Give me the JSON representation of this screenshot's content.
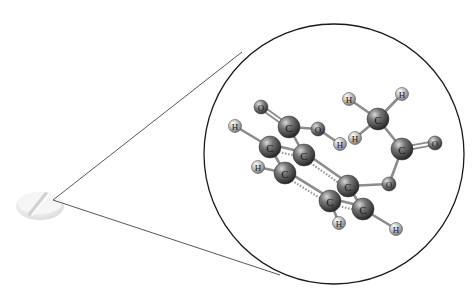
{
  "diagram": {
    "tablet": {
      "cx": 40,
      "cy": 205,
      "label": ""
    },
    "zoom_lines": {
      "apex": [
        53,
        200
      ],
      "upper_end": [
        242,
        52
      ],
      "lower_end": [
        280,
        275
      ]
    },
    "magnifier_circle": {
      "cx": 334,
      "cy": 154,
      "r": 130
    },
    "colors": {
      "carbon": "#3a3a3a",
      "oxygen": "#555555",
      "hydrogen": "#b8b8b8",
      "bond": "#8c8c8c",
      "outline": "#1a1a1a"
    },
    "atoms": [
      {
        "id": "O1",
        "el": "O",
        "x": 261,
        "y": 107
      },
      {
        "id": "C7",
        "el": "C",
        "x": 289,
        "y": 127
      },
      {
        "id": "O2",
        "el": "O",
        "x": 318,
        "y": 129
      },
      {
        "id": "H1",
        "el": "H",
        "x": 340,
        "y": 144
      },
      {
        "id": "H2",
        "el": "H",
        "x": 235,
        "y": 126
      },
      {
        "id": "C1",
        "el": "C",
        "x": 270,
        "y": 147
      },
      {
        "id": "C2",
        "el": "C",
        "x": 304,
        "y": 155
      },
      {
        "id": "H3",
        "el": "H",
        "x": 258,
        "y": 167
      },
      {
        "id": "C3",
        "el": "C",
        "x": 285,
        "y": 173
      },
      {
        "id": "C4",
        "el": "C",
        "x": 348,
        "y": 186
      },
      {
        "id": "C5",
        "el": "C",
        "x": 330,
        "y": 201
      },
      {
        "id": "C6",
        "el": "C",
        "x": 363,
        "y": 209
      },
      {
        "id": "H4",
        "el": "H",
        "x": 339,
        "y": 223
      },
      {
        "id": "H5",
        "el": "H",
        "x": 396,
        "y": 229
      },
      {
        "id": "O3",
        "el": "O",
        "x": 389,
        "y": 184
      },
      {
        "id": "C8",
        "el": "C",
        "x": 402,
        "y": 149
      },
      {
        "id": "O4",
        "el": "O",
        "x": 435,
        "y": 143
      },
      {
        "id": "C9",
        "el": "C",
        "x": 378,
        "y": 119
      },
      {
        "id": "H6",
        "el": "H",
        "x": 349,
        "y": 99
      },
      {
        "id": "H7",
        "el": "H",
        "x": 402,
        "y": 94
      },
      {
        "id": "H8",
        "el": "H",
        "x": 355,
        "y": 138
      }
    ],
    "bonds": [
      {
        "a": "O1",
        "b": "C7",
        "type": "double"
      },
      {
        "a": "C7",
        "b": "O2",
        "type": "single"
      },
      {
        "a": "O2",
        "b": "H1",
        "type": "single"
      },
      {
        "a": "C7",
        "b": "C2",
        "type": "single"
      },
      {
        "a": "H2",
        "b": "C1",
        "type": "single"
      },
      {
        "a": "C1",
        "b": "C2",
        "type": "aromatic"
      },
      {
        "a": "C1",
        "b": "C3",
        "type": "single"
      },
      {
        "a": "H3",
        "b": "C3",
        "type": "single"
      },
      {
        "a": "C3",
        "b": "C5",
        "type": "aromatic"
      },
      {
        "a": "C2",
        "b": "C4",
        "type": "aromatic"
      },
      {
        "a": "C4",
        "b": "C6",
        "type": "single"
      },
      {
        "a": "C5",
        "b": "C6",
        "type": "aromatic"
      },
      {
        "a": "C5",
        "b": "H4",
        "type": "single"
      },
      {
        "a": "C6",
        "b": "H5",
        "type": "single"
      },
      {
        "a": "C4",
        "b": "O3",
        "type": "single"
      },
      {
        "a": "O3",
        "b": "C8",
        "type": "single"
      },
      {
        "a": "C8",
        "b": "O4",
        "type": "double"
      },
      {
        "a": "C8",
        "b": "C9",
        "type": "single"
      },
      {
        "a": "C9",
        "b": "H6",
        "type": "single"
      },
      {
        "a": "C9",
        "b": "H7",
        "type": "single"
      },
      {
        "a": "C9",
        "b": "H8",
        "type": "single"
      }
    ]
  }
}
